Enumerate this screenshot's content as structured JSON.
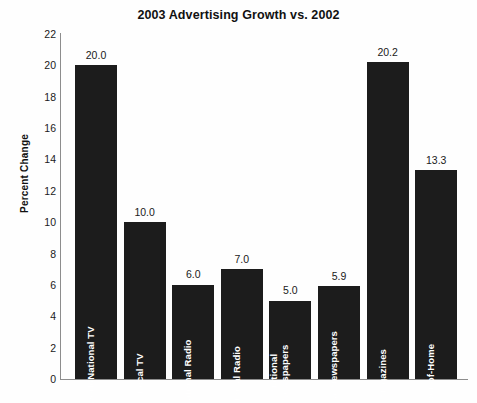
{
  "chart_data": {
    "type": "bar",
    "title": "2003 Advertising Growth vs. 2002",
    "xlabel": "",
    "ylabel": "Percent Change",
    "ylim": [
      0,
      22
    ],
    "ytick_step": 2,
    "yticks": [
      "22",
      "20",
      "18",
      "16",
      "14",
      "12",
      "10",
      "8",
      "6",
      "4",
      "2",
      "0"
    ],
    "grid": false,
    "legend": "none",
    "bar_color": "#1c1c1c",
    "value_label_format": "one-decimal",
    "categories": [
      "Network/National TV",
      "Local TV",
      "National Radio",
      "Local Radio",
      "National Newspapers",
      "Local Newspapers",
      "Magazines",
      "Out-of-Home"
    ],
    "values": [
      20.0,
      10.0,
      6.0,
      7.0,
      5.0,
      5.9,
      20.2,
      13.3
    ],
    "value_labels": [
      "20.0",
      "10.0",
      "6.0",
      "7.0",
      "5.0",
      "5.9",
      "20.2",
      "13.3"
    ],
    "bars": [
      {
        "label": "Network/National TV",
        "label_lines": "Network/National TV",
        "value": 20.0,
        "value_label": "20.0",
        "multiline": false
      },
      {
        "label": "Local TV",
        "label_lines": "Local TV",
        "value": 10.0,
        "value_label": "10.0",
        "multiline": false
      },
      {
        "label": "National Radio",
        "label_lines": "National Radio",
        "value": 6.0,
        "value_label": "6.0",
        "multiline": true
      },
      {
        "label": "Local Radio",
        "label_lines": "Local Radio",
        "value": 7.0,
        "value_label": "7.0",
        "multiline": false
      },
      {
        "label": "National Newspapers",
        "label_lines": "National Newspapers",
        "value": 5.0,
        "value_label": "5.0",
        "multiline": true
      },
      {
        "label": "Local Newspapers",
        "label_lines": "Local Newspapers",
        "value": 5.9,
        "value_label": "5.9",
        "multiline": true
      },
      {
        "label": "Magazines",
        "label_lines": "Magazines",
        "value": 20.2,
        "value_label": "20.2",
        "multiline": false
      },
      {
        "label": "Out-of-Home",
        "label_lines": "Out-of-Home",
        "value": 13.3,
        "value_label": "13.3",
        "multiline": false
      }
    ]
  }
}
